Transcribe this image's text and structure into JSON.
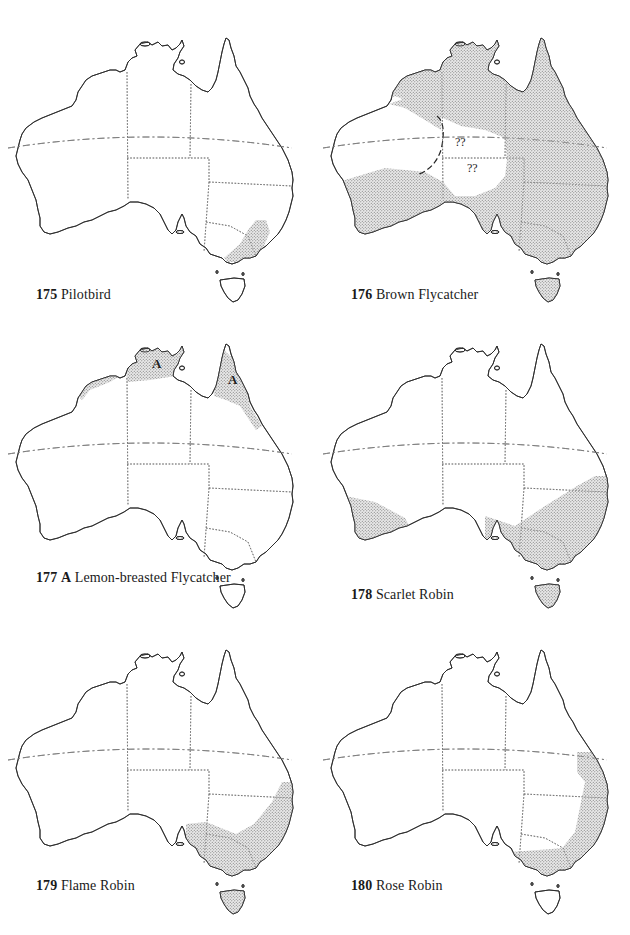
{
  "page": {
    "type": "bird distribution map plate",
    "stipple_color": "#8a8a8a",
    "line_color": "#2a2a2a"
  },
  "maps": [
    {
      "number": "175",
      "name": "Pilotbird",
      "marker": "",
      "range_description": "SE coastal Victoria and SE New South Wales"
    },
    {
      "number": "176",
      "name": "Brown Flycatcher",
      "marker": "",
      "range_description": "Most of Australia except western interior and central desert; uncertain areas marked ??",
      "annotations": [
        "??",
        "??"
      ]
    },
    {
      "number": "177",
      "name": "Lemon-breasted Flycatcher",
      "marker": "A",
      "range_description": "Northern coasts: Kimberley, Top End, Cape York",
      "annotations": [
        "A",
        "A"
      ]
    },
    {
      "number": "178",
      "name": "Scarlet Robin",
      "marker": "",
      "range_description": "SW Western Australia, SE Australia and Tasmania"
    },
    {
      "number": "179",
      "name": "Flame Robin",
      "marker": "",
      "range_description": "SE Australia highlands and Tasmania"
    },
    {
      "number": "180",
      "name": "Rose Robin",
      "marker": "",
      "range_description": "East coast from SE Queensland to Victoria"
    }
  ]
}
